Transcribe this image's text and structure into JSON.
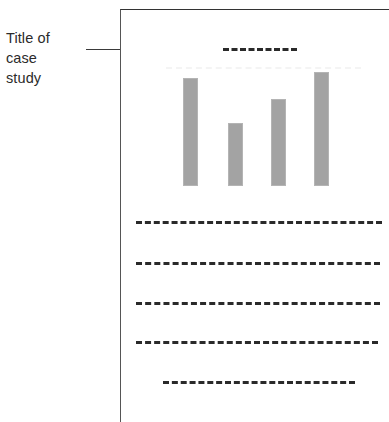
{
  "canvas": {
    "width": 389,
    "height": 422,
    "background": "#ffffff"
  },
  "annotation": {
    "label": "Title of\ncase\nstudy",
    "label_lines": [
      "Title of",
      "case",
      "study"
    ],
    "text_color": "#2b2b2b",
    "pointer": {
      "type": "arrow",
      "direction": "right",
      "line_color": "#3a3a3a",
      "arrowhead_color": "#1c1c1c"
    }
  },
  "document": {
    "border_color": "#444444",
    "background": "#ffffff",
    "title_placeholder": {
      "style": "dashed",
      "dash_count": 6,
      "color": "#2a2a2a"
    },
    "chart_caption": {
      "style": "dashed",
      "color": "#f4f4f4",
      "legible": false
    },
    "body_lines": [
      {
        "indent": 15,
        "length": 246,
        "style": "dashed",
        "color": "#2a2a2a"
      },
      {
        "indent": 15,
        "length": 244,
        "style": "dashed",
        "color": "#2a2a2a"
      },
      {
        "indent": 15,
        "length": 244,
        "style": "dashed",
        "color": "#2a2a2a"
      },
      {
        "indent": 15,
        "length": 242,
        "style": "dashed",
        "color": "#2a2a2a"
      },
      {
        "indent": 42,
        "length": 192,
        "style": "dashed",
        "color": "#2a2a2a"
      }
    ]
  },
  "chart_data": {
    "type": "bar",
    "title": "",
    "subtitle": "",
    "xlabel": "",
    "ylabel": "",
    "categories": [
      "1",
      "2",
      "3",
      "4"
    ],
    "values": [
      95,
      55,
      76,
      100
    ],
    "ylim": [
      0,
      100
    ],
    "grid": false,
    "legend": null,
    "bar_color": "#a3a3a3",
    "bar_edge_color": "#b4b4b4",
    "tick_labels": {
      "x": [],
      "y": []
    },
    "annotations": [],
    "note": "Placeholder bar chart in a mock document; bar heights read off pixel extents, axes unlabeled."
  }
}
